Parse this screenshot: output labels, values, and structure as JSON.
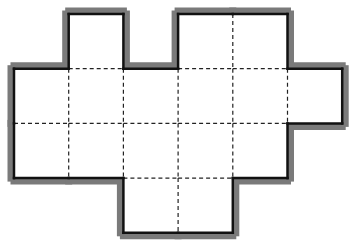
{
  "diagram": {
    "type": "grid-polyomino",
    "cell_size": 54.7,
    "origin": [
      14,
      14
    ],
    "columns": 6,
    "rows": 4,
    "cell_count": 16,
    "cells": [
      [
        1,
        0
      ],
      [
        3,
        0
      ],
      [
        4,
        0
      ],
      [
        0,
        1
      ],
      [
        1,
        1
      ],
      [
        2,
        1
      ],
      [
        3,
        1
      ],
      [
        4,
        1
      ],
      [
        5,
        1
      ],
      [
        0,
        2
      ],
      [
        1,
        2
      ],
      [
        2,
        2
      ],
      [
        3,
        2
      ],
      [
        4,
        2
      ],
      [
        2,
        3
      ],
      [
        3,
        3
      ]
    ],
    "colors": {
      "fill": "#ffffff",
      "border": "#111111",
      "shadow": "#7a7a7a",
      "grid": "#222222"
    }
  }
}
